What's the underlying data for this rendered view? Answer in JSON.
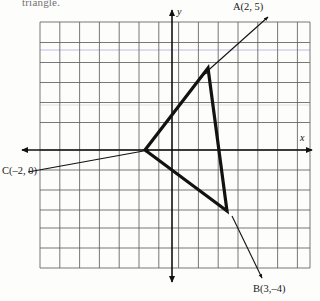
{
  "prompt": {
    "text": "triangle."
  },
  "axes": {
    "x_label": "x",
    "y_label": "y",
    "origin_px": {
      "x": 172,
      "y": 150
    },
    "cell_px": 19.8,
    "grid": {
      "left_px": 40,
      "right_px": 310,
      "top_px": 22,
      "bottom_px": 268,
      "cols": 14,
      "rows": 12,
      "visible": true,
      "color": "#4a4a4a"
    }
  },
  "points": [
    {
      "id": "A",
      "label": "A(2, 5)",
      "x": 2,
      "y": 5,
      "label_px": {
        "x": 233,
        "y": 1
      },
      "vertex_px": {
        "x": 208,
        "y": 68
      }
    },
    {
      "id": "B",
      "label": "B(3,–4)",
      "x": 3,
      "y": -4,
      "label_px": {
        "x": 253,
        "y": 283
      },
      "vertex_px": {
        "x": 227,
        "y": 211
      }
    },
    {
      "id": "C",
      "label": "C(–2, 0)",
      "x": -2,
      "y": 0,
      "label_px": {
        "x": 2,
        "y": 165
      },
      "vertex_px": {
        "x": 145,
        "y": 150
      }
    }
  ],
  "triangle": {
    "name": "triangle-abc",
    "stroke_color": "#121212",
    "stroke_width": 3.2,
    "vertices_px": [
      {
        "x": 208,
        "y": 68
      },
      {
        "x": 227,
        "y": 211
      },
      {
        "x": 145,
        "y": 150
      }
    ]
  },
  "leader_lines": [
    {
      "id": "leader-a",
      "from_px": {
        "x": 268,
        "y": 17
      },
      "to_px": {
        "x": 203,
        "y": 75
      }
    },
    {
      "id": "leader-b",
      "from_px": {
        "x": 262,
        "y": 278
      },
      "to_px": {
        "x": 232,
        "y": 216
      }
    },
    {
      "id": "leader-c",
      "from_px": {
        "x": 28,
        "y": 172
      },
      "to_px": {
        "x": 148,
        "y": 150
      }
    }
  ],
  "colors": {
    "ink": "#121212",
    "grid": "#4a4a4a",
    "paper": "#fdfdfc",
    "blue_tint": "#6f74c0",
    "green_tint": "#8fa98c"
  }
}
